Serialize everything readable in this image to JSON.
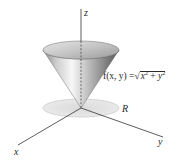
{
  "diagram": {
    "title": "",
    "surface": {
      "name": "cone",
      "equation_label": "f(x, y) = √(x² + y²)",
      "parts": {
        "lhs": "f(x, y) =",
        "radical_sign": "√",
        "x_base": "x",
        "x_exp": "2",
        "plus": " + ",
        "y_base": "y",
        "y_exp": "2"
      }
    },
    "region_label": "R",
    "axes": {
      "x": "x",
      "y": "y",
      "z": "z"
    },
    "colors": {
      "axis": "#333333",
      "cone_light": "#f4f4f4",
      "cone_dark": "#6e6e6e",
      "region_fill": "#e2e2e2",
      "region_edge": "#b8b8b8"
    }
  }
}
